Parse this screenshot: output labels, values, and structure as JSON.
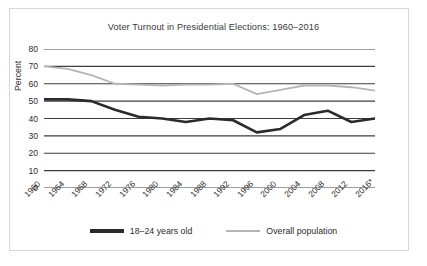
{
  "chart_data": {
    "type": "line",
    "title": "Voter Turnout in Presidential Elections: 1960–2016",
    "xlabel": "",
    "ylabel": "Percent",
    "ylim": [
      0,
      80
    ],
    "yticks": [
      0,
      10,
      20,
      30,
      40,
      50,
      60,
      70,
      80
    ],
    "grid": true,
    "legend_position": "bottom",
    "categories": [
      "1960",
      "1964",
      "1968",
      "1972",
      "1976",
      "1980",
      "1984",
      "1988",
      "1992",
      "1996",
      "2000",
      "2004",
      "2008",
      "2012",
      "2016*"
    ],
    "series": [
      {
        "name": "18–24 years old",
        "color": "#2b2b2b",
        "values": [
          51,
          51,
          50,
          45,
          41,
          40,
          38,
          40,
          39,
          32,
          34,
          42,
          44.5,
          38,
          40
        ]
      },
      {
        "name": "Overall population",
        "color": "#b5b5b5",
        "values": [
          70,
          68.5,
          65,
          60,
          59.5,
          59,
          59.5,
          59.5,
          60,
          54,
          56.5,
          59,
          59,
          58,
          56
        ]
      }
    ]
  },
  "legend": {
    "items": [
      {
        "label": "18–24 years old",
        "color": "#2b2b2b"
      },
      {
        "label": "Overall population",
        "color": "#b5b5b5"
      }
    ]
  },
  "axis": {
    "gridline_color": "#3d3d3d",
    "frame_color": "#d8d8d8"
  }
}
